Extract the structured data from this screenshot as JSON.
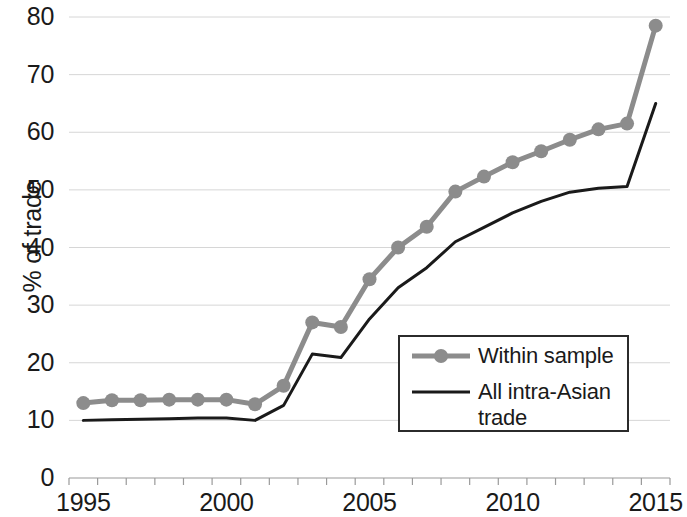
{
  "chart_data": {
    "type": "line",
    "title": "",
    "xlabel": "",
    "ylabel": "% of trade",
    "xlim": [
      1994.5,
      2015.5
    ],
    "ylim": [
      0,
      80
    ],
    "grid": true,
    "grid_axis": "y",
    "legend_position": "center-right",
    "x": [
      1995,
      1996,
      1997,
      1998,
      1999,
      2000,
      2001,
      2002,
      2003,
      2004,
      2005,
      2006,
      2007,
      2008,
      2009,
      2010,
      2011,
      2012,
      2013,
      2014,
      2015
    ],
    "xticklabels": [
      "1995",
      "2000",
      "2005",
      "2010",
      "2015"
    ],
    "xtickvalues": [
      1995,
      2000,
      2005,
      2010,
      2015
    ],
    "yticklabels": [
      "0",
      "10",
      "20",
      "30",
      "40",
      "50",
      "60",
      "70",
      "80"
    ],
    "ytickvalues": [
      0,
      10,
      20,
      30,
      40,
      50,
      60,
      70,
      80
    ],
    "series": [
      {
        "name": "Within sample",
        "color": "#8c8c8c",
        "marker": "circle",
        "values": [
          13.0,
          13.5,
          13.5,
          13.6,
          13.6,
          13.6,
          12.8,
          16.0,
          27.0,
          26.2,
          34.5,
          40.0,
          43.6,
          49.7,
          52.3,
          54.8,
          56.7,
          58.7,
          60.5,
          61.5,
          78.5
        ]
      },
      {
        "name": "All intra-Asian trade",
        "color": "#1a1a1a",
        "marker": "none",
        "values": [
          10.0,
          10.1,
          10.2,
          10.3,
          10.4,
          10.4,
          10.0,
          12.6,
          21.5,
          20.9,
          27.6,
          33.0,
          36.5,
          41.0,
          43.5,
          46.0,
          48.0,
          49.6,
          50.3,
          50.6,
          65.0
        ]
      }
    ]
  },
  "axis": {
    "y_title": "% of trade"
  },
  "legend": {
    "entries": [
      {
        "label": "Within sample"
      },
      {
        "label": "All intra-Asian\ntrade"
      }
    ]
  }
}
